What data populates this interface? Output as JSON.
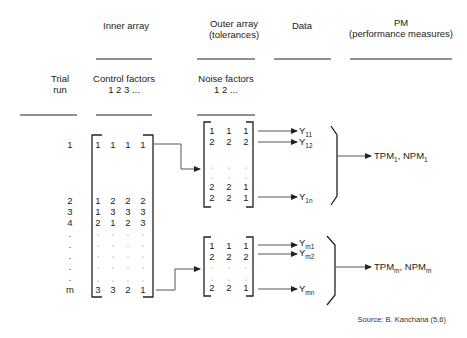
{
  "headers": {
    "inner_array": "Inner array",
    "outer_array": "Outer array",
    "outer_array_sub": "(tolerances)",
    "data": "Data",
    "pm": "PM",
    "pm_sub": "(performance measures)"
  },
  "subheaders": {
    "trial_line1": "Trial",
    "trial_line2": "run",
    "control_line1": "Control factors",
    "control_line2": "1 2 3 ...",
    "noise_line1": "Noise factors",
    "noise_line2": "1 2 ..."
  },
  "trial_runs": [
    "1",
    "2",
    "3",
    "4",
    ".",
    ".",
    ".",
    ".",
    ".",
    "m"
  ],
  "inner_matrix": {
    "row_1": [
      "1",
      "1",
      "1",
      "1"
    ],
    "row_2": [
      "1",
      "2",
      "2",
      "2"
    ],
    "row_3": [
      "1",
      "3",
      "3",
      "3"
    ],
    "row_4": [
      "2",
      "1",
      "2",
      "3"
    ],
    "row_m": [
      "3",
      "3",
      "2",
      "1"
    ]
  },
  "outer_matrix_1": {
    "rows": [
      [
        "1",
        "1",
        "1"
      ],
      [
        "2",
        "2",
        "2"
      ],
      [
        "2",
        "2",
        "1"
      ],
      [
        "2",
        "2",
        "1"
      ]
    ]
  },
  "outer_matrix_m": {
    "rows": [
      [
        "1",
        "1",
        "1"
      ],
      [
        "2",
        "2",
        "2"
      ],
      [
        "2",
        "2",
        "1"
      ]
    ]
  },
  "data_1": {
    "y11": {
      "base": "Y",
      "sub": "11"
    },
    "y12": {
      "base": "Y",
      "sub": "12"
    },
    "y1n": {
      "base": "Y",
      "sub": "1n"
    }
  },
  "data_m": {
    "ym1": {
      "base": "Y",
      "sub": "m1"
    },
    "ym2": {
      "base": "Y",
      "sub": "m2"
    },
    "ymn": {
      "base": "Y",
      "sub": "mn"
    }
  },
  "pm_1": {
    "tpm": "TPM",
    "tpm_sub": "1",
    "sep": ", ",
    "npm": "NPM",
    "npm_sub": "1"
  },
  "pm_m": {
    "tpm": "TPM",
    "tpm_sub": "m",
    "sep": ", ",
    "npm": "NPM",
    "npm_sub": "m"
  },
  "source": "Source: B. Kanchana (5,6)"
}
